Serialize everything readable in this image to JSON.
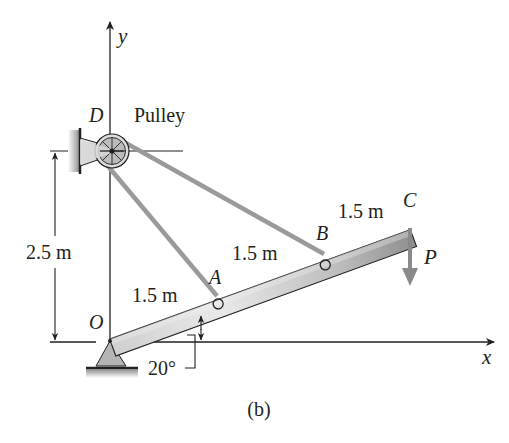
{
  "figure": {
    "caption": "(b)",
    "axes": {
      "x_label": "x",
      "y_label": "y"
    },
    "points": {
      "origin": "O",
      "pulley_point": "D",
      "a": "A",
      "b": "B",
      "c": "C"
    },
    "pulley_label": "Pulley",
    "force_label": "P",
    "dimensions": {
      "height": "2.5 m",
      "segment_oa": "1.5 m",
      "segment_ab": "1.5 m",
      "segment_bc": "1.5 m",
      "angle": "20°"
    },
    "colors": {
      "ink": "#231f20",
      "cable": "#9a9a9a",
      "bar_light": "#e6e6e6",
      "bar_dark": "#9c9c9c",
      "support": "#b5b5b5",
      "force_arrow": "#8a8a8a"
    }
  }
}
